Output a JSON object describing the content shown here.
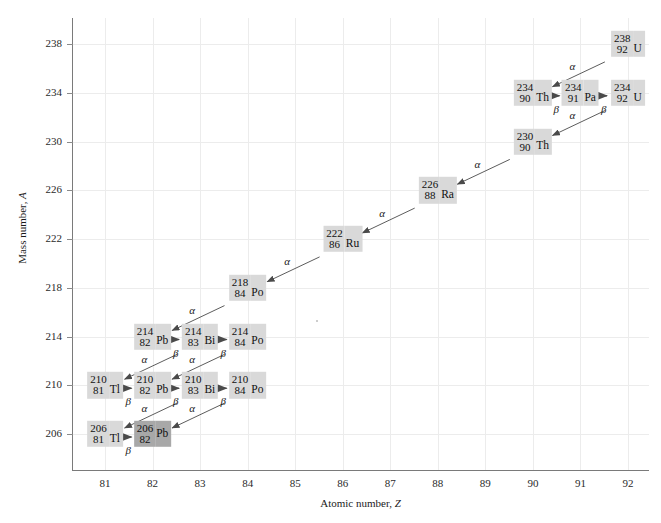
{
  "chart_data": {
    "type": "scatter",
    "title": "",
    "xlabel": "Atomic number, Z",
    "ylabel": "Mass number, A",
    "xlim": [
      80.3,
      92.6
    ],
    "ylim": [
      204.0,
      239.6
    ],
    "xticks": [
      81,
      82,
      83,
      84,
      85,
      86,
      87,
      88,
      89,
      90,
      91,
      92
    ],
    "yticks": [
      206,
      210,
      214,
      218,
      222,
      226,
      230,
      234,
      238
    ],
    "grid": true,
    "legend": "none",
    "nuclides": [
      {
        "mass": 238,
        "z": 92,
        "symbol": "U",
        "stable": false
      },
      {
        "mass": 234,
        "z": 90,
        "symbol": "Th",
        "stable": false
      },
      {
        "mass": 234,
        "z": 91,
        "symbol": "Pa",
        "stable": false
      },
      {
        "mass": 234,
        "z": 92,
        "symbol": "U",
        "stable": false
      },
      {
        "mass": 230,
        "z": 90,
        "symbol": "Th",
        "stable": false
      },
      {
        "mass": 226,
        "z": 88,
        "symbol": "Ra",
        "stable": false
      },
      {
        "mass": 222,
        "z": 86,
        "symbol": "Ru",
        "stable": false
      },
      {
        "mass": 218,
        "z": 84,
        "symbol": "Po",
        "stable": false
      },
      {
        "mass": 214,
        "z": 82,
        "symbol": "Pb",
        "stable": false
      },
      {
        "mass": 214,
        "z": 83,
        "symbol": "Bi",
        "stable": false
      },
      {
        "mass": 214,
        "z": 84,
        "symbol": "Po",
        "stable": false
      },
      {
        "mass": 210,
        "z": 81,
        "symbol": "Tl",
        "stable": false
      },
      {
        "mass": 210,
        "z": 82,
        "symbol": "Pb",
        "stable": false
      },
      {
        "mass": 210,
        "z": 83,
        "symbol": "Bi",
        "stable": false
      },
      {
        "mass": 210,
        "z": 84,
        "symbol": "Po",
        "stable": false
      },
      {
        "mass": 206,
        "z": 81,
        "symbol": "Tl",
        "stable": false
      },
      {
        "mass": 206,
        "z": 82,
        "symbol": "Pb",
        "stable": true
      }
    ],
    "decays": [
      {
        "from": {
          "mass": 238,
          "z": 92
        },
        "to": {
          "mass": 234,
          "z": 90
        },
        "mode": "α"
      },
      {
        "from": {
          "mass": 234,
          "z": 90
        },
        "to": {
          "mass": 234,
          "z": 91
        },
        "mode": "β"
      },
      {
        "from": {
          "mass": 234,
          "z": 91
        },
        "to": {
          "mass": 234,
          "z": 92
        },
        "mode": "β"
      },
      {
        "from": {
          "mass": 234,
          "z": 92
        },
        "to": {
          "mass": 230,
          "z": 90
        },
        "mode": "α"
      },
      {
        "from": {
          "mass": 230,
          "z": 90
        },
        "to": {
          "mass": 226,
          "z": 88
        },
        "mode": "α"
      },
      {
        "from": {
          "mass": 226,
          "z": 88
        },
        "to": {
          "mass": 222,
          "z": 86
        },
        "mode": "α"
      },
      {
        "from": {
          "mass": 222,
          "z": 86
        },
        "to": {
          "mass": 218,
          "z": 84
        },
        "mode": "α"
      },
      {
        "from": {
          "mass": 218,
          "z": 84
        },
        "to": {
          "mass": 214,
          "z": 82
        },
        "mode": "α"
      },
      {
        "from": {
          "mass": 214,
          "z": 82
        },
        "to": {
          "mass": 214,
          "z": 83
        },
        "mode": "β"
      },
      {
        "from": {
          "mass": 214,
          "z": 83
        },
        "to": {
          "mass": 214,
          "z": 84
        },
        "mode": "β"
      },
      {
        "from": {
          "mass": 214,
          "z": 83
        },
        "to": {
          "mass": 210,
          "z": 81
        },
        "mode": "α"
      },
      {
        "from": {
          "mass": 214,
          "z": 84
        },
        "to": {
          "mass": 210,
          "z": 82
        },
        "mode": "α"
      },
      {
        "from": {
          "mass": 210,
          "z": 81
        },
        "to": {
          "mass": 210,
          "z": 82
        },
        "mode": "β"
      },
      {
        "from": {
          "mass": 210,
          "z": 82
        },
        "to": {
          "mass": 210,
          "z": 83
        },
        "mode": "β"
      },
      {
        "from": {
          "mass": 210,
          "z": 83
        },
        "to": {
          "mass": 210,
          "z": 84
        },
        "mode": "β"
      },
      {
        "from": {
          "mass": 210,
          "z": 83
        },
        "to": {
          "mass": 206,
          "z": 81
        },
        "mode": "α"
      },
      {
        "from": {
          "mass": 210,
          "z": 84
        },
        "to": {
          "mass": 206,
          "z": 82
        },
        "mode": "α"
      },
      {
        "from": {
          "mass": 206,
          "z": 81
        },
        "to": {
          "mass": 206,
          "z": 82
        },
        "mode": "β"
      }
    ],
    "colors": {
      "box_fill": "#d9d9d9",
      "stable_box_fill": "#a8a8a8",
      "grid": "#ececec",
      "axis": "#7a7a7a",
      "arrow": "#4a4a4a",
      "text": "#111111"
    }
  }
}
